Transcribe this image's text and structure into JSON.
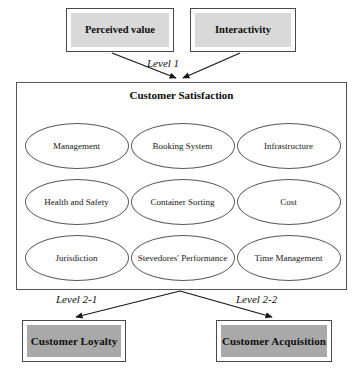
{
  "figure": {
    "type": "hierarchical-conceptual-model",
    "antecedents": [
      {
        "id": "perceived-value",
        "label": "Perceived value",
        "fill": "#d9d9d9"
      },
      {
        "id": "interactivity",
        "label": "Interactivity",
        "fill": "#d9d9d9"
      }
    ],
    "level_labels": {
      "level_1": "Level 1",
      "level_2_1": "Level 2-1",
      "level_2_2": "Level 2-2"
    },
    "core_construct": {
      "title": "Customer Satisfaction",
      "dimensions": [
        {
          "id": "management",
          "label": "Management"
        },
        {
          "id": "booking-system",
          "label": "Booking System"
        },
        {
          "id": "infrastructure",
          "label": "Infrastructure"
        },
        {
          "id": "health-and-safety",
          "label": "Health and Safety"
        },
        {
          "id": "container-sorting",
          "label": "Container Sorting"
        },
        {
          "id": "cost",
          "label": "Cost"
        },
        {
          "id": "jurisdiction",
          "label": "Jurisdiction"
        },
        {
          "id": "stevedores-performance",
          "label": "Stevedores' Performance"
        },
        {
          "id": "time-management",
          "label": "Time Management"
        }
      ]
    },
    "outcomes": [
      {
        "id": "customer-loyalty",
        "label": "Customer Loyalty",
        "fill": "#a9a9a9"
      },
      {
        "id": "customer-acquisition",
        "label": "Customer Acquisition",
        "fill": "#a9a9a9"
      }
    ],
    "caption": "",
    "colors": {
      "antecedent_fill": "#d9d9d9",
      "outcome_fill": "#a9a9a9",
      "stroke": "#4a4a4a",
      "background": "#ffffff"
    }
  }
}
